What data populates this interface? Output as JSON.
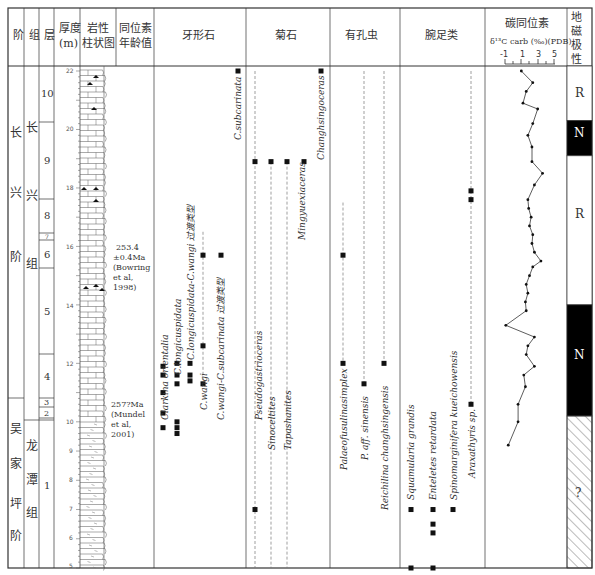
{
  "headers": {
    "stage": "阶",
    "formation": "组",
    "bed": "层",
    "thickness": "厚度",
    "thickness_unit": "(m)",
    "lithology_1": "岩性",
    "lithology_2": "柱状图",
    "isotope_age_1": "同位素",
    "isotope_age_2": "年龄值",
    "conodonts": "牙形石",
    "ammonoids": "菊石",
    "foraminifera": "有孔虫",
    "brachiopods": "腕足类",
    "carbon_isotope": "碳同位素",
    "carbon_isotope_unit": "δ¹³C carb (‰)(PDB)",
    "magnetic_1": "地",
    "magnetic_2": "磁",
    "magnetic_3": "极",
    "magnetic_4": "性"
  },
  "stages": [
    {
      "label": "长兴阶",
      "chars": [
        "长",
        "兴",
        "阶"
      ]
    },
    {
      "label": "吴家坪阶",
      "chars": [
        "吴",
        "家",
        "坪",
        "阶"
      ]
    }
  ],
  "formations": [
    {
      "label": "长兴组",
      "chars": [
        "长",
        "兴",
        "组"
      ]
    },
    {
      "label": "龙潭组",
      "chars": [
        "龙",
        "潭",
        "组"
      ]
    }
  ],
  "beds": [
    "10",
    "9",
    "8",
    "7",
    "6",
    "5",
    "4",
    "3",
    "2",
    "1"
  ],
  "ages": [
    {
      "lines": [
        "253.4",
        "±0.4Ma",
        "(Bowring",
        "et al,",
        "1998)"
      ]
    },
    {
      "lines": [
        "257?Ma",
        "(Mundel",
        "et al,",
        "2001)"
      ]
    }
  ],
  "chart_data": {
    "type": "line",
    "depth_axis": {
      "label": "厚度(m)",
      "range": [
        5,
        22
      ],
      "ticks": [
        5,
        6,
        7,
        8,
        9,
        10,
        11,
        12,
        13,
        14,
        15,
        16,
        17,
        18,
        19,
        20,
        21,
        22
      ]
    },
    "beds": [
      {
        "bed": "1",
        "from_m": 5.0,
        "to_m": 10.0
      },
      {
        "bed": "2",
        "from_m": 10.0,
        "to_m": 10.4
      },
      {
        "bed": "3",
        "from_m": 10.4,
        "to_m": 10.7
      },
      {
        "bed": "4",
        "from_m": 10.7,
        "to_m": 12.5
      },
      {
        "bed": "5",
        "from_m": 12.5,
        "to_m": 15.3
      },
      {
        "bed": "6",
        "from_m": 15.3,
        "to_m": 16.3
      },
      {
        "bed": "7",
        "from_m": 16.3,
        "to_m": 16.5
      },
      {
        "bed": "8",
        "from_m": 16.5,
        "to_m": 17.7
      },
      {
        "bed": "9",
        "from_m": 17.7,
        "to_m": 20.3
      },
      {
        "bed": "10",
        "from_m": 20.3,
        "to_m": 22.3
      }
    ],
    "carbon_isotope": {
      "xlabel": "δ13C carb (‰)(PDB)",
      "xlim": [
        -1,
        5
      ],
      "xticks": [
        -1,
        1,
        3,
        5
      ],
      "depth_m": [
        22.0,
        21.6,
        21.3,
        20.9,
        20.7,
        20.2,
        19.8,
        19.4,
        18.9,
        18.5,
        18.1,
        17.6,
        17.3,
        17.0,
        16.7,
        16.4,
        16.1,
        15.8,
        15.5,
        15.3,
        15.0,
        14.7,
        14.4,
        14.1,
        13.8,
        13.3,
        12.9,
        12.6,
        12.3,
        11.9,
        11.6,
        11.2,
        10.6,
        10.0,
        9.2
      ],
      "delta13C": [
        1.0,
        2.4,
        1.6,
        1.2,
        3.0,
        2.4,
        1.8,
        2.3,
        2.3,
        3.6,
        2.6,
        1.8,
        1.9,
        2.2,
        2.0,
        2.4,
        2.3,
        2.6,
        3.4,
        2.4,
        2.0,
        1.6,
        1.8,
        1.5,
        1.6,
        -0.9,
        2.6,
        1.8,
        1.6,
        2.6,
        1.3,
        1.5,
        0.6,
        0.6,
        -0.6
      ]
    },
    "magnetic_polarity": [
      {
        "label": "R",
        "from_m": 20.3,
        "to_m": 22.3,
        "fill": "#ffffff"
      },
      {
        "label": "N",
        "from_m": 19.1,
        "to_m": 20.3,
        "fill": "#000000"
      },
      {
        "label": "R",
        "from_m": 14.0,
        "to_m": 19.1,
        "fill": "#ffffff"
      },
      {
        "label": "N",
        "from_m": 10.2,
        "to_m": 14.0,
        "fill": "#000000"
      },
      {
        "label": "?",
        "from_m": 5.0,
        "to_m": 10.2,
        "fill": "hatch"
      }
    ],
    "taxa": {
      "conodonts": [
        {
          "name": "Clarkina orientalia",
          "x": 163,
          "occurrences_m": [
            9.8,
            11.0,
            11.6,
            11.9,
            10.3
          ]
        },
        {
          "name": "C.longicuspidata",
          "x": 177,
          "occurrences_m": [
            9.6,
            9.8,
            10.0,
            11.3,
            11.6,
            12.0
          ]
        },
        {
          "name": "C.longicuspidata-C.wangi 过渡类型",
          "x": 190,
          "occurrences_m": [
            11.4,
            11.6,
            12.0
          ]
        },
        {
          "name": "C.wangi",
          "x": 203,
          "occurrences_m": [
            11.3,
            12.6,
            15.7
          ],
          "range_dashed": [
            11.3,
            16.5
          ]
        },
        {
          "name": "C.wangi-C.subcarinata 过渡类型",
          "x": 221,
          "occurrences_m": [
            15.7
          ]
        },
        {
          "name": "C.subcarinata",
          "x": 238,
          "occurrences_m": [
            22.0
          ]
        }
      ],
      "ammonoids": [
        {
          "name": "Pseudogastrioceras",
          "x": 255,
          "occurrences_m": [
            7.0,
            18.9
          ],
          "range_dashed": [
            5.0,
            22.0
          ]
        },
        {
          "name": "Sinoceltites",
          "x": 271,
          "occurrences_m": [
            18.9
          ],
          "range_dashed": [
            5.0,
            18.9
          ]
        },
        {
          "name": "Tapashanites",
          "x": 287,
          "occurrences_m": [
            18.9
          ],
          "range_dashed": [
            5.0,
            18.9
          ]
        },
        {
          "name": "Mingyuexiaceras",
          "x": 304,
          "occurrences_m": [
            18.9
          ]
        },
        {
          "name": "Changhsingoceras",
          "x": 321,
          "occurrences_m": [
            22.0
          ]
        }
      ],
      "foraminifera": [
        {
          "name": "Palaeofusulinasimplex",
          "x": 343,
          "occurrences_m": [
            12.0,
            15.7
          ],
          "range_dashed": [
            12.0,
            17.5
          ]
        },
        {
          "name": "P. aff. sinensis",
          "x": 364,
          "occurrences_m": [
            11.3
          ],
          "range_dashed": [
            11.3,
            22.0
          ]
        },
        {
          "name": "Reichilina changhsingensis",
          "x": 384,
          "occurrences_m": [
            12.0
          ],
          "range_dashed": [
            12.0,
            22.0
          ]
        }
      ],
      "brachiopods": [
        {
          "name": "Squamularia grandis",
          "x": 411,
          "occurrences_m": [
            5.0,
            7.0
          ]
        },
        {
          "name": "Enteletes retardata",
          "x": 433,
          "occurrences_m": [
            5.0,
            6.2,
            6.5,
            7.0
          ]
        },
        {
          "name": "Spinomarginifera kueichowensis",
          "x": 453,
          "occurrences_m": [
            7.0
          ]
        },
        {
          "name": "Araxathyris sp.",
          "x": 471,
          "occurrences_m": [
            10.6,
            17.6,
            17.9
          ],
          "range_dashed": [
            10.6,
            22.0
          ]
        }
      ]
    }
  },
  "magnetic_labels": [
    "R",
    "N",
    "R",
    "N",
    "?"
  ]
}
